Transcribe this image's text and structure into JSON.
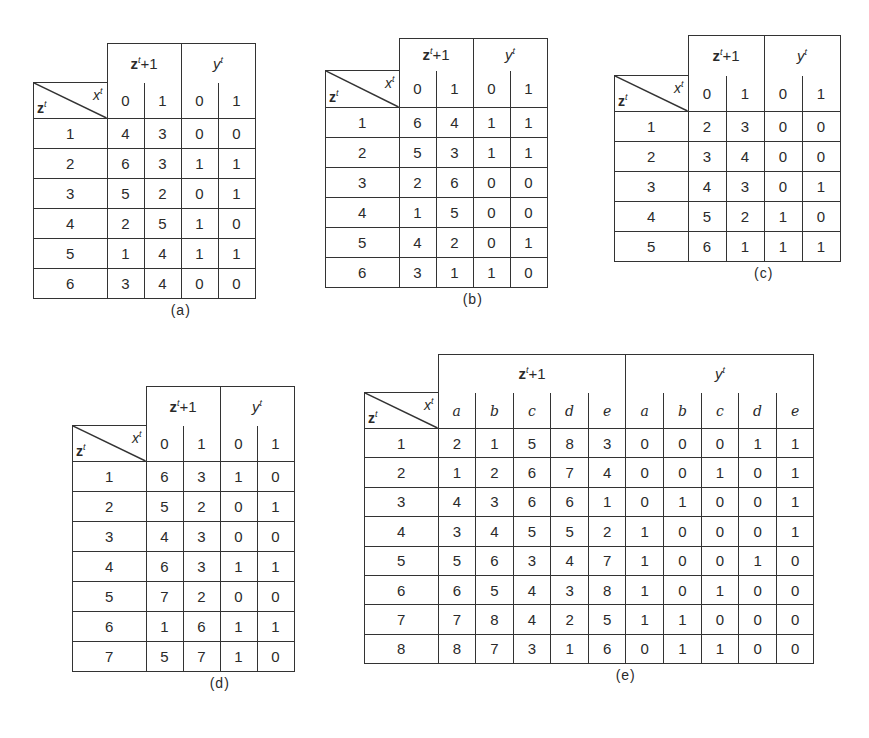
{
  "figures": [
    {
      "id": "a",
      "caption": "(a)",
      "state_label": "z",
      "input_label": "x",
      "superscript": "t",
      "next_label": "z",
      "next_sup": "t",
      "next_suffix": "+1",
      "output_label": "y",
      "output_sup": "t",
      "inputs": [
        "0",
        "1"
      ],
      "rows": [
        {
          "state": "1",
          "next": [
            "4",
            "3"
          ],
          "out": [
            "0",
            "0"
          ]
        },
        {
          "state": "2",
          "next": [
            "6",
            "3"
          ],
          "out": [
            "1",
            "1"
          ]
        },
        {
          "state": "3",
          "next": [
            "5",
            "2"
          ],
          "out": [
            "0",
            "1"
          ]
        },
        {
          "state": "4",
          "next": [
            "2",
            "5"
          ],
          "out": [
            "1",
            "0"
          ]
        },
        {
          "state": "5",
          "next": [
            "1",
            "4"
          ],
          "out": [
            "1",
            "1"
          ]
        },
        {
          "state": "6",
          "next": [
            "3",
            "4"
          ],
          "out": [
            "0",
            "0"
          ]
        }
      ]
    },
    {
      "id": "b",
      "caption": "(b)",
      "state_label": "z",
      "input_label": "x",
      "superscript": "t",
      "next_label": "z",
      "next_sup": "t",
      "next_suffix": "+1",
      "output_label": "y",
      "output_sup": "t",
      "inputs": [
        "0",
        "1"
      ],
      "rows": [
        {
          "state": "1",
          "next": [
            "6",
            "4"
          ],
          "out": [
            "1",
            "1"
          ]
        },
        {
          "state": "2",
          "next": [
            "5",
            "3"
          ],
          "out": [
            "1",
            "1"
          ]
        },
        {
          "state": "3",
          "next": [
            "2",
            "6"
          ],
          "out": [
            "0",
            "0"
          ]
        },
        {
          "state": "4",
          "next": [
            "1",
            "5"
          ],
          "out": [
            "0",
            "0"
          ]
        },
        {
          "state": "5",
          "next": [
            "4",
            "2"
          ],
          "out": [
            "0",
            "1"
          ]
        },
        {
          "state": "6",
          "next": [
            "3",
            "1"
          ],
          "out": [
            "1",
            "0"
          ]
        }
      ]
    },
    {
      "id": "c",
      "caption": "(c)",
      "state_label": "z",
      "input_label": "x",
      "superscript": "t",
      "next_label": "z",
      "next_sup": "t",
      "next_suffix": "+1",
      "output_label": "y",
      "output_sup": "t",
      "inputs": [
        "0",
        "1"
      ],
      "rows": [
        {
          "state": "1",
          "next": [
            "2",
            "3"
          ],
          "out": [
            "0",
            "0"
          ]
        },
        {
          "state": "2",
          "next": [
            "3",
            "4"
          ],
          "out": [
            "0",
            "0"
          ]
        },
        {
          "state": "3",
          "next": [
            "4",
            "3"
          ],
          "out": [
            "0",
            "1"
          ]
        },
        {
          "state": "4",
          "next": [
            "5",
            "2"
          ],
          "out": [
            "1",
            "0"
          ]
        },
        {
          "state": "5",
          "next": [
            "6",
            "1"
          ],
          "out": [
            "1",
            "1"
          ]
        }
      ]
    },
    {
      "id": "d",
      "caption": "(d)",
      "state_label": "z",
      "input_label": "x",
      "superscript": "t",
      "next_label": "z",
      "next_sup": "t",
      "next_suffix": "+1",
      "output_label": "y",
      "output_sup": "t",
      "inputs": [
        "0",
        "1"
      ],
      "rows": [
        {
          "state": "1",
          "next": [
            "6",
            "3"
          ],
          "out": [
            "1",
            "0"
          ]
        },
        {
          "state": "2",
          "next": [
            "5",
            "2"
          ],
          "out": [
            "0",
            "1"
          ]
        },
        {
          "state": "3",
          "next": [
            "4",
            "3"
          ],
          "out": [
            "0",
            "0"
          ]
        },
        {
          "state": "4",
          "next": [
            "6",
            "3"
          ],
          "out": [
            "1",
            "1"
          ]
        },
        {
          "state": "5",
          "next": [
            "7",
            "2"
          ],
          "out": [
            "0",
            "0"
          ]
        },
        {
          "state": "6",
          "next": [
            "1",
            "6"
          ],
          "out": [
            "1",
            "1"
          ]
        },
        {
          "state": "7",
          "next": [
            "5",
            "7"
          ],
          "out": [
            "1",
            "0"
          ]
        }
      ]
    },
    {
      "id": "e",
      "caption": "(e)",
      "state_label": "z",
      "input_label": "x",
      "superscript": "t",
      "next_label": "z",
      "next_sup": "t",
      "next_suffix": "+1",
      "output_label": "y",
      "output_sup": "t",
      "inputs": [
        "a",
        "b",
        "c",
        "d",
        "e"
      ],
      "rows": [
        {
          "state": "1",
          "next": [
            "2",
            "1",
            "5",
            "8",
            "3"
          ],
          "out": [
            "0",
            "0",
            "0",
            "1",
            "1"
          ]
        },
        {
          "state": "2",
          "next": [
            "1",
            "2",
            "6",
            "7",
            "4"
          ],
          "out": [
            "0",
            "0",
            "1",
            "0",
            "1"
          ]
        },
        {
          "state": "3",
          "next": [
            "4",
            "3",
            "6",
            "6",
            "1"
          ],
          "out": [
            "0",
            "1",
            "0",
            "0",
            "1"
          ]
        },
        {
          "state": "4",
          "next": [
            "3",
            "4",
            "5",
            "5",
            "2"
          ],
          "out": [
            "1",
            "0",
            "0",
            "0",
            "1"
          ]
        },
        {
          "state": "5",
          "next": [
            "5",
            "6",
            "3",
            "4",
            "7"
          ],
          "out": [
            "1",
            "0",
            "0",
            "1",
            "0"
          ]
        },
        {
          "state": "6",
          "next": [
            "6",
            "5",
            "4",
            "3",
            "8"
          ],
          "out": [
            "1",
            "0",
            "1",
            "0",
            "0"
          ]
        },
        {
          "state": "7",
          "next": [
            "7",
            "8",
            "4",
            "2",
            "5"
          ],
          "out": [
            "1",
            "1",
            "0",
            "0",
            "0"
          ]
        },
        {
          "state": "8",
          "next": [
            "8",
            "7",
            "3",
            "1",
            "6"
          ],
          "out": [
            "0",
            "1",
            "1",
            "0",
            "0"
          ]
        }
      ]
    }
  ],
  "layout": {
    "a": {
      "left": 33,
      "top": 43,
      "corner_w": 73,
      "cell_w": 36,
      "head_h": 39,
      "sub_h": 36,
      "row_h": 30
    },
    "b": {
      "left": 325,
      "top": 38,
      "corner_w": 73,
      "cell_w": 36,
      "head_h": 32,
      "sub_h": 37,
      "row_h": 30
    },
    "c": {
      "left": 614,
      "top": 35,
      "corner_w": 73,
      "cell_w": 37,
      "head_h": 40,
      "sub_h": 36,
      "row_h": 30
    },
    "d": {
      "left": 72,
      "top": 386,
      "corner_w": 73,
      "cell_w": 36,
      "head_h": 39,
      "sub_h": 36,
      "row_h": 30
    },
    "e": {
      "left": 364,
      "top": 354,
      "corner_w": 73,
      "cell_w": 36.6,
      "head_h": 38,
      "sub_h": 36,
      "row_h": 29.4
    }
  }
}
